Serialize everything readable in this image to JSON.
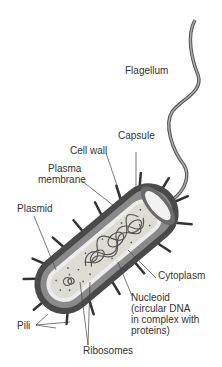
{
  "diagram": {
    "labels": {
      "flagellum": "Flagellum",
      "capsule": "Capsule",
      "cell_wall": "Cell wall",
      "plasma_membrane_1": "Plasma",
      "plasma_membrane_2": "membrane",
      "plasmid": "Plasmid",
      "cytoplasm": "Cytoplasm",
      "nucleoid_1": "Nucleoid",
      "nucleoid_2": "(circular DNA",
      "nucleoid_3": "in complex with",
      "nucleoid_4": "proteins)",
      "pili": "Pili",
      "ribosomes": "Ribosomes"
    },
    "colors": {
      "capsule": "#4a4a4a",
      "cell_wall": "#8a8a8a",
      "membrane": "#e8e8e8",
      "cytoplasm": "#dcdcd4",
      "dna": "#555555",
      "leader": "#444444"
    }
  }
}
